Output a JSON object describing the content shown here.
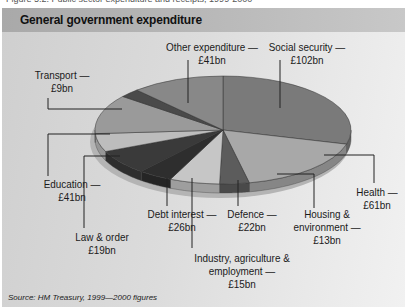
{
  "caption": "Figure 5.2: Public sector expenditure and receipts, 1999-2000",
  "chart_data": {
    "type": "pie",
    "title": "General government expenditure",
    "unit": "£bn",
    "categories": [
      "Social security",
      "Health",
      "Housing & environment",
      "Defence",
      "Industry, agriculture & employment",
      "Debt interest",
      "Law & order",
      "Education",
      "Transport",
      "Other expenditure"
    ],
    "values": [
      102,
      61,
      13,
      22,
      15,
      26,
      19,
      41,
      9,
      41
    ],
    "start_angle_deg": 0,
    "direction": "clockwise",
    "style": "3d-tilted",
    "legend": "callout-labels",
    "source": "Source: HM Treasury, 1999—2000 figures"
  },
  "labels": {
    "social": {
      "name": "Social security —",
      "value": "£102bn"
    },
    "health": {
      "name": "Health —",
      "value": "£61bn"
    },
    "housing": {
      "name1": "Housing &",
      "name2": "environment —",
      "value": "£13bn"
    },
    "defence": {
      "name": "Defence —",
      "value": "£22bn"
    },
    "industry": {
      "name1": "Industry, agriculture &",
      "name2": "employment —",
      "value": "£15bn"
    },
    "debt": {
      "name": "Debt interest —",
      "value": "£26bn"
    },
    "law": {
      "name": "Law & order",
      "value": "£19bn"
    },
    "education": {
      "name": "Education —",
      "value": "£41bn"
    },
    "transport": {
      "name": "Transport —",
      "value": "£9bn"
    },
    "other": {
      "name": "Other expenditure —",
      "value": "£41bn"
    }
  },
  "colors": {
    "social": "#7a7a7a",
    "health": "#a8a8a8",
    "housing": "#5c5c5c",
    "defence": "#c6c6c6",
    "industry": "#2e2e2e",
    "debt": "#3a3a3a",
    "law": "#bdbdbd",
    "education": "#9a9a9a",
    "transport": "#4a4a4a",
    "other": "#888888"
  }
}
